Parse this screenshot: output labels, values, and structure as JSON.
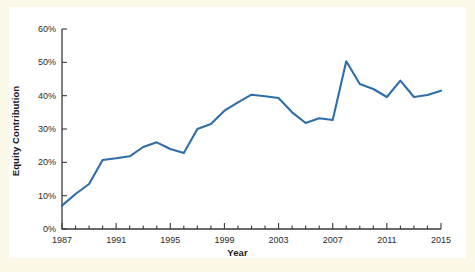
{
  "figure": {
    "background_color": "#fbf8e8",
    "panel_color": "#ffffff",
    "line_color": "#2e6da8",
    "axis_color": "#3a3a3a",
    "text_color": "#1a1a1a"
  },
  "chart_data": {
    "type": "line",
    "title": "",
    "xlabel": "Year",
    "ylabel": "Equity Contribution",
    "xlim": [
      1987,
      2015
    ],
    "ylim": [
      0,
      60
    ],
    "grid": false,
    "legend": null,
    "ytick_labels": [
      "0%",
      "10%",
      "20%",
      "30%",
      "40%",
      "50%",
      "60%"
    ],
    "ytick_values": [
      0,
      10,
      20,
      30,
      40,
      50,
      60
    ],
    "xtick_labels": [
      "1987",
      "1991",
      "1995",
      "1999",
      "2003",
      "2007",
      "2011",
      "2015"
    ],
    "xtick_values": [
      1987,
      1991,
      1995,
      1999,
      2003,
      2007,
      2011,
      2015
    ],
    "x_minor_tick_step": 1,
    "units": "percent",
    "x": [
      1987,
      1988,
      1989,
      1990,
      1991,
      1992,
      1993,
      1994,
      1995,
      1996,
      1997,
      1998,
      1999,
      2000,
      2001,
      2002,
      2003,
      2004,
      2005,
      2006,
      2007,
      2008,
      2009,
      2010,
      2011,
      2012,
      2013,
      2014,
      2015
    ],
    "series": [
      {
        "name": "Equity Contribution",
        "values": [
          7.0,
          10.5,
          13.5,
          20.7,
          21.2,
          21.8,
          24.6,
          26.0,
          24.0,
          22.8,
          30.0,
          31.5,
          35.5,
          38.0,
          40.3,
          39.8,
          39.3,
          35.0,
          31.8,
          33.2,
          32.7,
          50.3,
          43.5,
          42.0,
          39.6,
          44.5,
          39.6,
          40.2,
          41.5
        ]
      }
    ]
  }
}
